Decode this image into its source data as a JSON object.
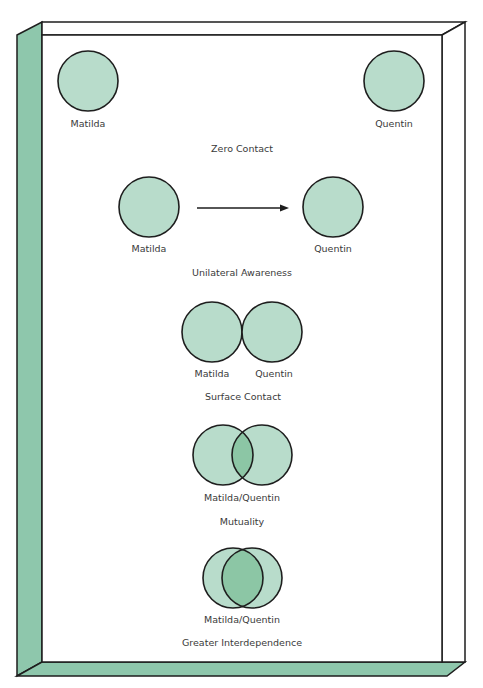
{
  "colors": {
    "frame_side": "#8ec7ac",
    "circle_fill": "#b8dccb",
    "overlap_fill": "#8cc6a5",
    "stroke": "#1e1e1e",
    "text": "#3a3a3a"
  },
  "stages": [
    {
      "title": "Zero Contact",
      "labels": [
        "Matilda",
        "Quentin"
      ]
    },
    {
      "title": "Unilateral Awareness",
      "labels": [
        "Matilda",
        "Quentin"
      ]
    },
    {
      "title": "Surface Contact",
      "labels": [
        "Matilda",
        "Quentin"
      ]
    },
    {
      "title": "Mutuality",
      "labels": [
        "Matilda/Quentin"
      ]
    },
    {
      "title": "Greater Interdependence",
      "labels": [
        "Matilda/Quentin"
      ]
    }
  ]
}
